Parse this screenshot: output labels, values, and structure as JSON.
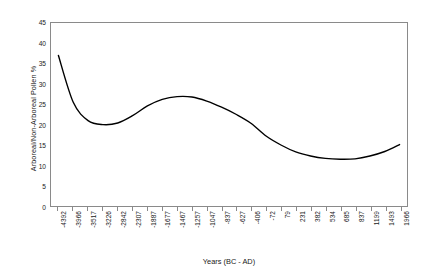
{
  "chart_data": {
    "type": "line",
    "title": "",
    "xlabel": "Years (BC - AD)",
    "ylabel": "Arboreal/Non-Arboreal Pollen %",
    "ylim": [
      0,
      45
    ],
    "y_ticks": [
      0,
      5,
      10,
      15,
      20,
      25,
      30,
      35,
      40,
      45
    ],
    "grid": false,
    "legend": "none",
    "line_color": "#000000",
    "categories": [
      "-4392",
      "-3966",
      "-3517",
      "-3226",
      "-2842",
      "-2307",
      "-1887",
      "-1677",
      "-1467",
      "-1257",
      "-1047",
      "-837",
      "-627",
      "-406",
      "-72",
      "79",
      "231",
      "382",
      "534",
      "685",
      "837",
      "1199",
      "1493",
      "1966"
    ],
    "values": [
      37.0,
      25.5,
      21.0,
      20.0,
      20.4,
      22.2,
      24.6,
      26.2,
      26.9,
      26.8,
      25.8,
      24.3,
      22.5,
      20.3,
      17.2,
      15.0,
      13.3,
      12.3,
      11.7,
      11.5,
      11.6,
      12.3,
      13.4,
      15.1
    ],
    "series": [
      {
        "name": "Arboreal/Non-Arboreal Pollen %",
        "values": [
          37.0,
          25.5,
          21.0,
          20.0,
          20.4,
          22.2,
          24.6,
          26.2,
          26.9,
          26.8,
          25.8,
          24.3,
          22.5,
          20.3,
          17.2,
          15.0,
          13.3,
          12.3,
          11.7,
          11.5,
          11.6,
          12.3,
          13.4,
          15.1
        ]
      }
    ],
    "annotations": {
      "start_value": 37.0,
      "first_minimum": 20.0,
      "peak_value": 26.9,
      "late_minimum": 11.5,
      "end_value": 15.1
    }
  },
  "colors": {
    "line": "#000000",
    "frame": "#8a8a8a",
    "text": "#1a1a1a",
    "background": "#ffffff"
  }
}
